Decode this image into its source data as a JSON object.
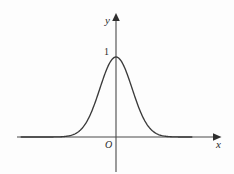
{
  "figure": {
    "title": "",
    "background_color": "#fdfdfd",
    "stroke_color": "#3a3a3a",
    "label_color": "#2b2b2b"
  },
  "labels": {
    "y_axis": "y",
    "x_axis": "x",
    "origin": "O",
    "peak_tick": "1"
  },
  "chart_data": {
    "type": "line",
    "title": "",
    "xlabel": "x",
    "ylabel": "y",
    "grid": false,
    "legend": null,
    "annotations": [
      {
        "text": "O",
        "role": "origin-label",
        "x": 0,
        "y": 0
      },
      {
        "text": "1",
        "role": "y-tick-label",
        "x": 0,
        "y": 1
      }
    ],
    "axis": {
      "x_arrow": true,
      "y_arrow": true,
      "xlim": [
        -4.1,
        3.3
      ],
      "ylim": [
        -0.55,
        1.55
      ],
      "x_ticks": [],
      "y_ticks": [
        1
      ]
    },
    "series": [
      {
        "name": "bell-curve",
        "description": "symmetric bell-shaped curve peaking at 1",
        "x": [
          -4.0,
          -3.6,
          -3.2,
          -2.8,
          -2.4,
          -2.0,
          -1.6,
          -1.2,
          -0.8,
          -0.4,
          0.0,
          0.4,
          0.8,
          1.2,
          1.6,
          2.0,
          2.4,
          2.8,
          3.2
        ],
        "y": [
          0.018,
          0.028,
          0.044,
          0.069,
          0.106,
          0.16,
          0.238,
          0.35,
          0.5,
          0.69,
          1.0,
          0.69,
          0.5,
          0.35,
          0.238,
          0.16,
          0.106,
          0.069,
          0.044
        ]
      }
    ]
  }
}
